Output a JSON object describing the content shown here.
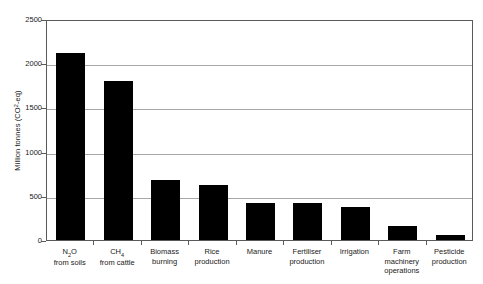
{
  "chart_data": {
    "type": "bar",
    "title": "",
    "subtitle": "",
    "xlabel": "",
    "ylabel": "Million tonnes (CO2-eq)",
    "ylabel_parts": {
      "prefix": "Million tonnes (CO",
      "subscript": "2",
      "suffix": "-eq)"
    },
    "ylim": [
      0,
      2500
    ],
    "yticks": [
      0,
      500,
      1000,
      1500,
      2000,
      2500
    ],
    "ytick_labels": [
      "0",
      "500",
      "1000",
      "1500",
      "2000",
      "2500"
    ],
    "grid": true,
    "grid_axis": "y",
    "legend": null,
    "legend_position": "none",
    "bar_color": "#000000",
    "grid_color": "#a8a8a8",
    "frame_color": "#5a5a5a",
    "background_color": "#ffffff",
    "categories": [
      "N2O from soils",
      "CH4 from cattle",
      "Biomass burning",
      "Rice production",
      "Manure",
      "Fertiliser production",
      "Irrigation",
      "Farm machinery operations",
      "Pesticide production"
    ],
    "category_label_lines": [
      [
        "N",
        "2",
        "O",
        "from soils"
      ],
      [
        "CH",
        "4",
        "",
        "from cattle"
      ],
      [
        "Biomass",
        "",
        "",
        "burning"
      ],
      [
        "Rice",
        "",
        "",
        "production"
      ],
      [
        "Manure",
        "",
        "",
        ""
      ],
      [
        "Fertiliser",
        "",
        "",
        "production"
      ],
      [
        "Irrigation",
        "",
        "",
        ""
      ],
      [
        "Farm",
        "",
        "",
        "machinery|operations"
      ],
      [
        "Pesticide",
        "",
        "",
        "production"
      ]
    ],
    "values": [
      2120,
      1800,
      680,
      620,
      420,
      420,
      375,
      160,
      60
    ],
    "series": [
      {
        "name": "Greenhouse gas emissions",
        "values": [
          2120,
          1800,
          680,
          620,
          420,
          420,
          375,
          160,
          60
        ]
      }
    ]
  },
  "x_labels": [
    {
      "line1_main": "N",
      "line1_sub": "2",
      "line1_tail": "O",
      "line2": "from soils",
      "line3": ""
    },
    {
      "line1_main": "CH",
      "line1_sub": "4",
      "line1_tail": "",
      "line2": "from cattle",
      "line3": ""
    },
    {
      "line1_main": "Biomass",
      "line1_sub": "",
      "line1_tail": "",
      "line2": "burning",
      "line3": ""
    },
    {
      "line1_main": "Rice",
      "line1_sub": "",
      "line1_tail": "",
      "line2": "production",
      "line3": ""
    },
    {
      "line1_main": "Manure",
      "line1_sub": "",
      "line1_tail": "",
      "line2": "",
      "line3": ""
    },
    {
      "line1_main": "Fertiliser",
      "line1_sub": "",
      "line1_tail": "",
      "line2": "production",
      "line3": ""
    },
    {
      "line1_main": "Irrigation",
      "line1_sub": "",
      "line1_tail": "",
      "line2": "",
      "line3": ""
    },
    {
      "line1_main": "Farm",
      "line1_sub": "",
      "line1_tail": "",
      "line2": "machinery",
      "line3": "operations"
    },
    {
      "line1_main": "Pesticide",
      "line1_sub": "",
      "line1_tail": "",
      "line2": "production",
      "line3": ""
    }
  ]
}
